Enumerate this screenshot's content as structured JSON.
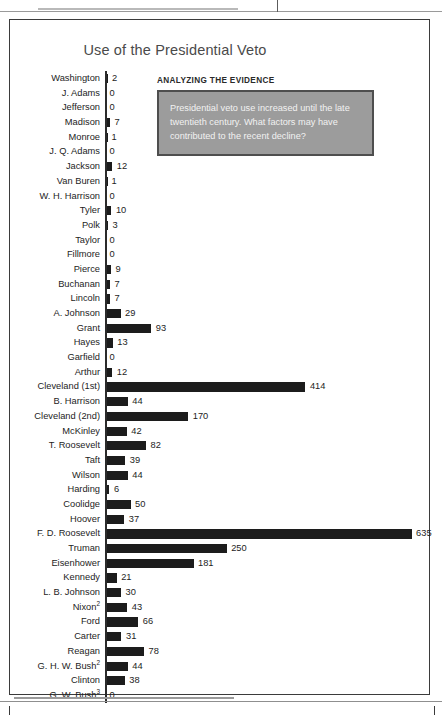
{
  "figure": {
    "title": "Use of the Presidential Veto"
  },
  "analysis": {
    "heading": "ANALYZING THE EVIDENCE",
    "text": "Presidential veto use increased until the late twentieth century. What factors may have contributed to the recent decline?"
  },
  "chart_data": {
    "type": "bar",
    "title": "Use of the Presidential Veto",
    "orientation": "horizontal",
    "xlabel": "",
    "ylabel": "",
    "xlim": [
      0,
      635
    ],
    "grid": false,
    "legend": null,
    "bar_color": "#1c1c1c",
    "categories": [
      "Washington",
      "J. Adams",
      "Jefferson",
      "Madison",
      "Monroe",
      "J. Q. Adams",
      "Jackson",
      "Van Buren",
      "W. H. Harrison",
      "Tyler",
      "Polk",
      "Taylor",
      "Fillmore",
      "Pierce",
      "Buchanan",
      "Lincoln",
      "A. Johnson",
      "Grant",
      "Hayes",
      "Garfield",
      "Arthur",
      "Cleveland (1st)",
      "B. Harrison",
      "Cleveland (2nd)",
      "McKinley",
      "T. Roosevelt",
      "Taft",
      "Wilson",
      "Harding",
      "Coolidge",
      "Hoover",
      "F. D. Roosevelt",
      "Truman",
      "Eisenhower",
      "Kennedy",
      "L. B. Johnson",
      "Nixon",
      "Ford",
      "Carter",
      "Reagan",
      "G. H. W. Bush",
      "Clinton",
      "G. W. Bush"
    ],
    "footnote_markers": {
      "Nixon": "2",
      "G. H. W. Bush": "2",
      "G. W. Bush": "3"
    },
    "values": [
      2,
      0,
      0,
      7,
      1,
      0,
      12,
      1,
      0,
      10,
      3,
      0,
      0,
      9,
      7,
      7,
      29,
      93,
      13,
      0,
      12,
      414,
      44,
      170,
      42,
      82,
      39,
      44,
      6,
      50,
      37,
      635,
      250,
      181,
      21,
      30,
      43,
      66,
      31,
      78,
      44,
      38,
      0
    ]
  }
}
